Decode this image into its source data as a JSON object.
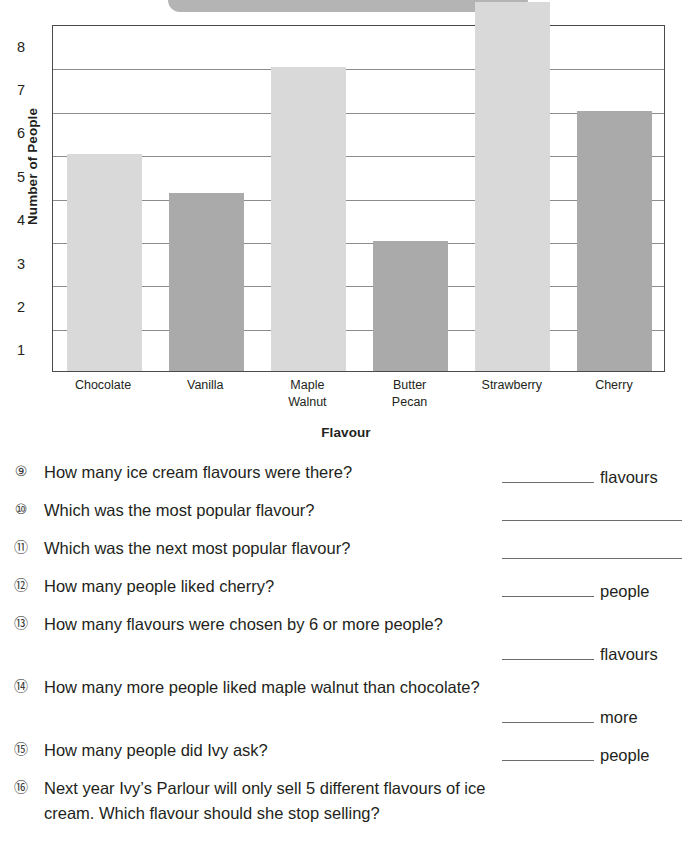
{
  "banner": {
    "visible": true,
    "color": "#b4b4b4"
  },
  "chart_data": {
    "type": "bar",
    "title": "",
    "xlabel": "Flavour",
    "ylabel": "Number of People",
    "categories": [
      "Chocolate",
      "Vanilla",
      "Maple\nWalnut",
      "Butter\nPecan",
      "Strawberry",
      "Cherry"
    ],
    "category_labels": [
      [
        "Chocolate"
      ],
      [
        "Vanilla"
      ],
      [
        "Maple",
        "Walnut"
      ],
      [
        "Butter",
        "Pecan"
      ],
      [
        "Strawberry"
      ],
      [
        "Cherry"
      ]
    ],
    "values": [
      5.5,
      4.6,
      7.5,
      3.5,
      9,
      6.5
    ],
    "bar_shades": [
      "light",
      "dark",
      "light",
      "dark",
      "light",
      "dark"
    ],
    "colors": {
      "light": "#d9d9d9",
      "dark": "#aaaaaa",
      "axis": "#4a4a4a",
      "grid": "#8c8c8c"
    },
    "ytick_labels": [
      "8",
      "7",
      "6",
      "5",
      "4",
      "3",
      "2",
      "1"
    ],
    "ylim": [
      0.5,
      8.5
    ],
    "grid": true,
    "legend": "none"
  },
  "questions": [
    {
      "number": "⑨",
      "text": "How many ice cream flavours were there?",
      "unit": "flavours",
      "answer_value": ""
    },
    {
      "number": "⑩",
      "text": "Which was the most popular flavour?",
      "unit": "",
      "answer_value": ""
    },
    {
      "number": "⑪",
      "text": "Which was the next most popular flavour?",
      "unit": "",
      "answer_value": ""
    },
    {
      "number": "⑫",
      "text": "How many people liked cherry?",
      "unit": "people",
      "answer_value": ""
    },
    {
      "number": "⑬",
      "text": "How many flavours were chosen by 6 or more people?",
      "unit": "flavours",
      "answer_value": ""
    },
    {
      "number": "⑭",
      "text": "How many more people liked maple walnut than chocolate?",
      "unit": "more",
      "answer_value": ""
    },
    {
      "number": "⑮",
      "text": "How many people did Ivy ask?",
      "unit": "people",
      "answer_value": ""
    },
    {
      "number": "⑯",
      "text": "Next year Ivy’s Parlour will only sell 5 different flavours of ice cream.  Which flavour should she stop selling?",
      "unit": "",
      "answer_value": ""
    }
  ]
}
